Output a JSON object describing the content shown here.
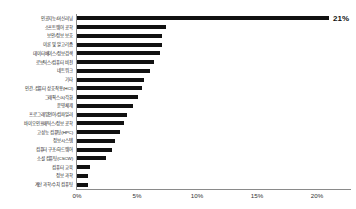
{
  "chart_data": {
    "type": "bar",
    "orientation": "horizontal",
    "title": "",
    "xlabel": "",
    "ylabel": "",
    "xlim": [
      0,
      23
    ],
    "xticks": [
      0,
      5,
      10,
      15,
      20
    ],
    "xtick_labels": [
      "0%",
      "5%",
      "10%",
      "15%",
      "20%"
    ],
    "grid": false,
    "bar_color": "#111111",
    "axis_color": "#8a8a8a",
    "categories": [
      "인공지능/머신러닝",
      "소프트웨어 공학",
      "보안/정보 보호",
      "이론 및 알고리즘",
      "데이터베이스/정보검색",
      "로보틱스/컴퓨터 비전",
      "네트워크",
      "기타",
      "인간-컴퓨터 상호작용(HCI)",
      "그래픽스/시각화",
      "운영체제",
      "프로그래밍언어/컴파일러",
      "바이오인포매틱스/정보 공학",
      "고성능 컴퓨팅(HPC)",
      "정보시스템",
      "컴퓨터 구조/하드웨어",
      "소셜 컴퓨팅(CSCW)",
      "컴퓨터 교육",
      "정보 과학",
      "계산 과학/수치 컴퓨팅"
    ],
    "values": [
      21,
      7.4,
      7.1,
      7.1,
      6.9,
      6.4,
      6.1,
      5.6,
      5.4,
      5.1,
      4.7,
      4.2,
      3.9,
      3.6,
      3.2,
      2.9,
      2.4,
      1.1,
      0.9,
      0.9
    ],
    "labeled_points": [
      {
        "category": "인공지능/머신러닝",
        "value": 21,
        "label": "21%"
      }
    ]
  }
}
